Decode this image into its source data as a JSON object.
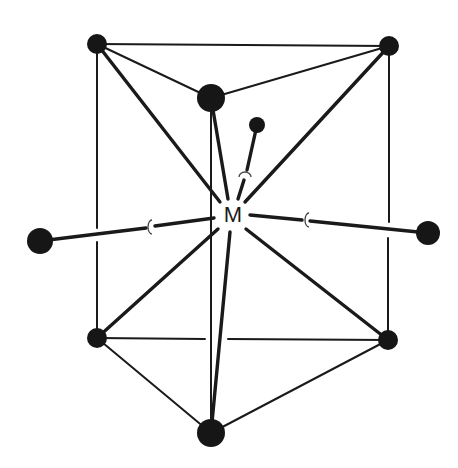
{
  "diagram": {
    "type": "tricapped trigonal prism coordination geometry",
    "center": {
      "label": "M",
      "x": 232,
      "y": 215
    },
    "colors": {
      "stroke": "#1a1a1a",
      "atom": "#161616",
      "background": "#ffffff"
    },
    "atoms": [
      {
        "id": "prism-top-left",
        "x": 97,
        "y": 44,
        "r": 10
      },
      {
        "id": "prism-top-right",
        "x": 389,
        "y": 46,
        "r": 10
      },
      {
        "id": "prism-top-front",
        "x": 211,
        "y": 98,
        "r": 14
      },
      {
        "id": "prism-bottom-left",
        "x": 97,
        "y": 338,
        "r": 10
      },
      {
        "id": "prism-bottom-right",
        "x": 388,
        "y": 340,
        "r": 10
      },
      {
        "id": "prism-bottom-front",
        "x": 211,
        "y": 433,
        "r": 14
      },
      {
        "id": "cap-left",
        "x": 40,
        "y": 241,
        "r": 13
      },
      {
        "id": "cap-right",
        "x": 428,
        "y": 233,
        "r": 12
      },
      {
        "id": "cap-back",
        "x": 257,
        "y": 125,
        "r": 8
      }
    ],
    "cap_markers": [
      {
        "id": "marker-left",
        "x": 150,
        "y": 227
      },
      {
        "id": "marker-right",
        "x": 306,
        "y": 220
      },
      {
        "id": "marker-back",
        "x": 245,
        "y": 174
      }
    ]
  }
}
